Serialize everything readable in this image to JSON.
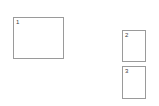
{
  "page": {
    "background_color": "#ffffff",
    "width": 159,
    "height": 106
  },
  "style": {
    "panel_border_color": "#9a9a9a",
    "panel_fill_color": "#ffffff",
    "label_color": "#3a3a3a"
  },
  "panels": [
    {
      "id": "panel-1",
      "label": "1",
      "shape": "rectangle",
      "orientation": "landscape"
    },
    {
      "id": "panel-2",
      "label": "2",
      "shape": "rectangle",
      "orientation": "portrait"
    },
    {
      "id": "panel-3",
      "label": "3",
      "shape": "rectangle",
      "orientation": "portrait"
    }
  ]
}
